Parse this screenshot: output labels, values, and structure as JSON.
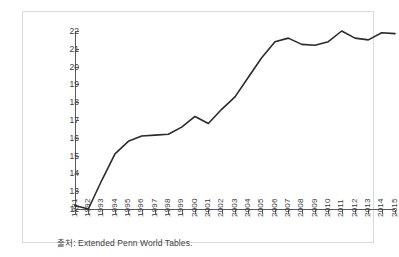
{
  "figure": {
    "title_faint": "",
    "source_note": "출처: Extended Penn World Tables."
  },
  "chart_data": {
    "type": "line",
    "title": "",
    "subtitle": "",
    "xlabel": "",
    "ylabel": "",
    "grid": false,
    "legend": false,
    "legend_position": "none",
    "line_color": "#2b2b2e",
    "ylim": [
      12,
      22
    ],
    "yticks": [
      12,
      13,
      14,
      15,
      16,
      17,
      18,
      19,
      20,
      21,
      22
    ],
    "ytick_labels": [
      "12",
      "13",
      "14",
      "15",
      "16",
      "17",
      "18",
      "19",
      "20",
      "21",
      "22"
    ],
    "xlim": [
      1991,
      2015
    ],
    "categories": [
      "1991",
      "1992",
      "1993",
      "1994",
      "1995",
      "1996",
      "1997",
      "1998",
      "1999",
      "2000",
      "2001",
      "2002",
      "2003",
      "2004",
      "2005",
      "2006",
      "2007",
      "2008",
      "2009",
      "2010",
      "2011",
      "2012",
      "2013",
      "2014",
      "2015"
    ],
    "x": [
      1991,
      1992,
      1993,
      1994,
      1995,
      1996,
      1997,
      1998,
      1999,
      2000,
      2001,
      2002,
      2003,
      2004,
      2005,
      2006,
      2007,
      2008,
      2009,
      2010,
      2011,
      2012,
      2013,
      2014,
      2015
    ],
    "values": [
      12.2,
      12.0,
      13.6,
      15.1,
      15.8,
      16.1,
      16.15,
      16.2,
      16.6,
      17.2,
      16.8,
      17.6,
      18.3,
      19.4,
      20.5,
      21.4,
      21.6,
      21.25,
      21.2,
      21.4,
      22.0,
      21.6,
      21.5,
      21.9,
      21.85
    ],
    "series": [
      {
        "name": "Extended Penn World Tables series",
        "values": [
          12.2,
          12.0,
          13.6,
          15.1,
          15.8,
          16.1,
          16.15,
          16.2,
          16.6,
          17.2,
          16.8,
          17.6,
          18.3,
          19.4,
          20.5,
          21.4,
          21.6,
          21.25,
          21.2,
          21.4,
          22.0,
          21.6,
          21.5,
          21.9,
          21.85
        ]
      }
    ],
    "annotations": []
  }
}
